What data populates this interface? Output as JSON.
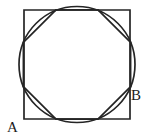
{
  "figure": {
    "title": "Square with inscribed circle and inscribed octagon",
    "background_color": "#ffffff",
    "stroke_color": "#252525",
    "stroke_width": 1.7,
    "canvas": {
      "width": 147,
      "height": 138
    },
    "square": {
      "name": "outer-square",
      "left": 24,
      "top": 10,
      "right": 130,
      "bottom": 119,
      "width": 106,
      "height": 109,
      "points": "24,10 130,10 130,119 24,119"
    },
    "circle": {
      "name": "inscribed-circle",
      "cx": 77,
      "cy": 64.5,
      "r": 58
    },
    "octagon": {
      "name": "inscribed-octagon",
      "sides": 8,
      "cx": 77,
      "cy": 64.5,
      "circumradius": 58,
      "rotation_deg": 22.5,
      "points": "130.6,42.3 98.0,9.8 56.0,9.8 23.4,42.3 23.4,86.7 56.0,119.2 98.0,119.2 130.6,86.7"
    },
    "labels": [
      {
        "id": "label-a",
        "text": "A",
        "x": 7,
        "y": 132,
        "anchor": "start"
      },
      {
        "id": "label-b",
        "text": "B",
        "x": 131,
        "y": 100,
        "anchor": "start"
      }
    ]
  }
}
